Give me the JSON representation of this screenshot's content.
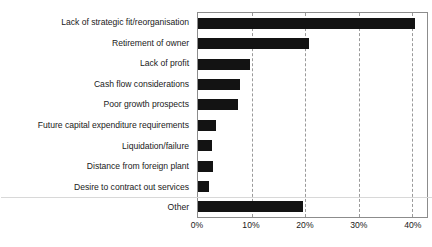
{
  "chart_data": {
    "type": "bar",
    "orientation": "horizontal",
    "title": "",
    "subtitle": "",
    "xlabel": "",
    "ylabel": "",
    "xlim": [
      0,
      42.8
    ],
    "grid": "vertical-dashed",
    "legend": "none",
    "value_suffix": "%",
    "xticks": [
      {
        "label": "0%",
        "value": 0
      },
      {
        "label": "10%",
        "value": 10
      },
      {
        "label": "20%",
        "value": 20
      },
      {
        "label": "30%",
        "value": 30
      },
      {
        "label": "40%",
        "value": 40
      }
    ],
    "bar_color": "#131313",
    "categories": [
      "Lack of strategic fit/reorganisation",
      "Retirement of owner",
      "Lack of profit",
      "Cash flow considerations",
      "Poor growth prospects",
      "Future capital expenditure requirements",
      "Liquidation/failure",
      "Distance from foreign plant",
      "Desire to contract out services",
      "Other"
    ],
    "values": [
      40.5,
      20.7,
      9.8,
      7.8,
      7.4,
      3.3,
      2.6,
      2.8,
      2.0,
      19.6
    ]
  },
  "axis": {
    "tick_0": "0%",
    "tick_1": "10%",
    "tick_2": "20%",
    "tick_3": "30%",
    "tick_4": "40%"
  },
  "labels": {
    "cat_0": "Lack of strategic fit/reorganisation",
    "cat_1": "Retirement of owner",
    "cat_2": "Lack of profit",
    "cat_3": "Cash flow considerations",
    "cat_4": "Poor growth prospects",
    "cat_5": "Future capital expenditure requirements",
    "cat_6": "Liquidation/failure",
    "cat_7": "Distance from foreign plant",
    "cat_8": "Desire to contract out services",
    "cat_9": "Other"
  }
}
